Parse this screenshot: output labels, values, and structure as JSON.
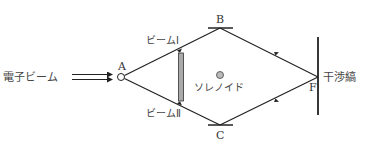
{
  "diagram": {
    "title": "",
    "labels": {
      "electron_beam": "電子ビーム",
      "point_a": "A",
      "point_b": "B",
      "point_c": "C",
      "point_f": "F",
      "beam_1": "ビームⅠ",
      "beam_2": "ビームⅡ",
      "solenoid": "ソレノイド",
      "fringes": "干渉縞"
    },
    "colors": {
      "line": "#222222",
      "biprism_fill": "#aaaaaa",
      "text": "#333333"
    }
  }
}
